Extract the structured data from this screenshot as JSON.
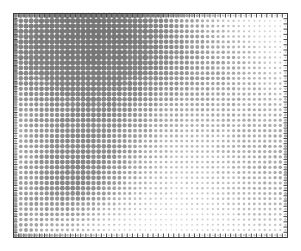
{
  "figure": {
    "name": "dot-matrix-scatter-figure",
    "width": 301,
    "height": 251,
    "background_color": "#ffffff"
  },
  "chart_data": {
    "type": "scatter",
    "title": "",
    "subtitle": "",
    "xlabel": "",
    "ylabel": "",
    "legend": [],
    "annotations": [],
    "grid": false,
    "legend_position": "none",
    "plot_frame": {
      "left": 13,
      "top": 13,
      "right": 288,
      "bottom": 238,
      "border_color": "#3c3c3c",
      "border_width": 1,
      "fill_color": "#ffffff"
    },
    "axes": {
      "x": {
        "range": [
          0,
          53
        ],
        "ticks_inward": true,
        "tick_count": 53,
        "tick_length": 4,
        "tick_color": "#4a4a4a",
        "tick_labels": []
      },
      "y": {
        "range": [
          0,
          43
        ],
        "ticks_inward": true,
        "tick_count": 43,
        "tick_length": 4,
        "tick_color": "#4a4a4a",
        "tick_labels": []
      },
      "top_ticks": true,
      "right_ticks": true
    },
    "marker": {
      "shape": "circle",
      "min_radius": 0.6,
      "max_radius": 3.1,
      "min_gray": "#efefef",
      "max_gray": "#6b6b6b",
      "colormap": "grayscale"
    },
    "grid_layout": {
      "columns": 53,
      "rows": 43,
      "x_step": 5.19,
      "y_step": 5.23,
      "x_origin": 15.6,
      "y_origin": 15.6
    },
    "field_model": {
      "note": "Amplitude field sampled on the grid; value in [0,1] maps to both marker radius and gray darkness.",
      "components": [
        {
          "type": "plane_wave",
          "amplitude": 0.5,
          "kx": 0.58,
          "ky": 0.3,
          "phase": 0.4
        },
        {
          "type": "plane_wave",
          "amplitude": 0.42,
          "kx": -0.27,
          "ky": 0.63,
          "phase": 1.9
        },
        {
          "type": "plane_wave",
          "amplitude": 0.33,
          "kx": 0.21,
          "ky": -0.22,
          "phase": 3.1
        },
        {
          "type": "radial_wave",
          "amplitude": 0.3,
          "cx": 0.22,
          "cy": 0.78,
          "k": 1.35,
          "phase": 0.6
        },
        {
          "type": "radial_wave",
          "amplitude": 0.28,
          "cx": 0.82,
          "cy": 0.18,
          "k": 1.15,
          "phase": 2.3
        },
        {
          "type": "blob",
          "amplitude": 0.4,
          "cx": 0.84,
          "cy": 0.26,
          "sigma": 0.26
        },
        {
          "type": "blob",
          "amplitude": 0.36,
          "cx": 0.2,
          "cy": 0.76,
          "sigma": 0.22
        },
        {
          "type": "blob",
          "amplitude": 0.3,
          "cx": 0.31,
          "cy": 0.46,
          "sigma": 0.2
        },
        {
          "type": "blob",
          "amplitude": 0.22,
          "cx": 0.55,
          "cy": 0.8,
          "sigma": 0.17
        },
        {
          "type": "blob",
          "amplitude": -0.34,
          "cx": 0.52,
          "cy": 0.3,
          "sigma": 0.22
        },
        {
          "type": "blob",
          "amplitude": -0.28,
          "cx": 0.12,
          "cy": 0.22,
          "sigma": 0.2
        },
        {
          "type": "blob",
          "amplitude": -0.26,
          "cx": 0.72,
          "cy": 0.62,
          "sigma": 0.2
        }
      ],
      "noise_amplitude": 0.07,
      "noise_seed": 20240517
    }
  }
}
